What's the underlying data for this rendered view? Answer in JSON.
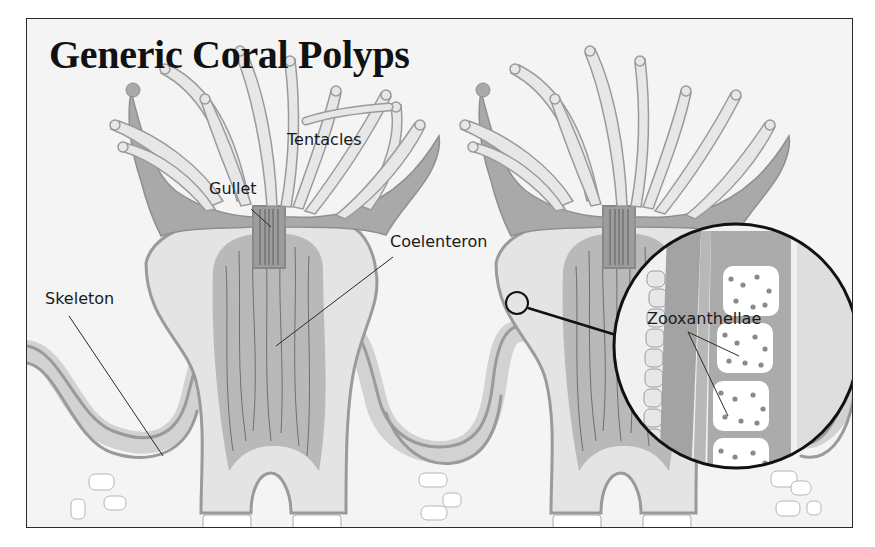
{
  "title": "Generic Coral Polyps",
  "labels": {
    "tentacles": "Tentacles",
    "gullet": "Gullet",
    "coelenteron": "Coelenteron",
    "skeleton": "Skeleton",
    "zooxanthellae": "Zooxanthellae"
  },
  "colors": {
    "background": "#f4f4f4",
    "tissue_light": "#e6e6e6",
    "tissue_mid": "#c9c9c9",
    "tissue_dark": "#a6a6a6",
    "outline": "#8f8f8f",
    "ink": "#111111"
  }
}
